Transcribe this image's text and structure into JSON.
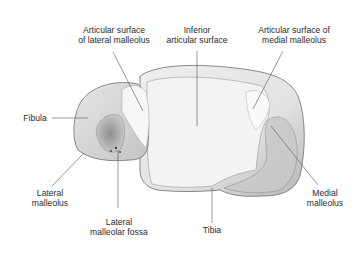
{
  "figure": {
    "colors": {
      "bone_light": "#f4f4f4",
      "bone_mid": "#d9d9d9",
      "bone_shadow": "#9a9a9a",
      "outline": "#6e6e6e",
      "leader_line": "#555555",
      "label_text": "#2b2b2b"
    }
  },
  "labels": {
    "art_lat_malleolus": {
      "line1": "Articular surface",
      "line2": "of lateral malleolus"
    },
    "inferior_art": {
      "line1": "Inferior",
      "line2": "articular surface"
    },
    "art_med_malleolus": {
      "line1": "Articular surface of",
      "line2": "medial malleolus"
    },
    "fibula": {
      "line1": "Fibula"
    },
    "lateral_malleolus": {
      "line1": "Lateral",
      "line2": "malleolus"
    },
    "lateral_fossa": {
      "line1": "Lateral",
      "line2": "malleolar fossa"
    },
    "tibia": {
      "line1": "Tibia"
    },
    "medial_malleolus": {
      "line1": "Medial",
      "line2": "malleolus"
    }
  }
}
